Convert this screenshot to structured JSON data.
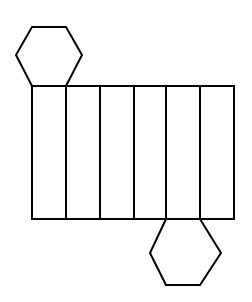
{
  "figure": {
    "title": "Net of a hexagonal prism",
    "canvas": {
      "width": 252,
      "height": 302,
      "background_color": "#ffffff"
    },
    "style": {
      "stroke_color": "#000000",
      "stroke_width": 2,
      "fill_color": "#ffffff"
    },
    "geometry": {
      "band": {
        "name": "lateral-faces-band",
        "left": 32,
        "right": 234,
        "top": 86,
        "bottom": 219,
        "panel_count": 6,
        "divider_x": [
          32,
          66,
          100,
          134,
          166,
          200,
          234
        ],
        "panels": [
          {
            "index": 1,
            "x0": 32,
            "x1": 66,
            "y0": 86,
            "y1": 219
          },
          {
            "index": 2,
            "x0": 66,
            "x1": 100,
            "y0": 86,
            "y1": 219
          },
          {
            "index": 3,
            "x0": 100,
            "x1": 134,
            "y0": 86,
            "y1": 219
          },
          {
            "index": 4,
            "x0": 134,
            "x1": 166,
            "y0": 86,
            "y1": 219
          },
          {
            "index": 5,
            "x0": 166,
            "x1": 200,
            "y0": 86,
            "y1": 219
          },
          {
            "index": 6,
            "x0": 200,
            "x1": 234,
            "y0": 86,
            "y1": 219
          }
        ]
      },
      "top_hexagon": {
        "name": "top-hexagon-face",
        "attached_to_panel": 1,
        "position": "above",
        "points": "32,86 16,55 32,27 66,27 82,55 66,86"
      },
      "bottom_hexagon": {
        "name": "bottom-hexagon-face",
        "attached_to_panel": 5,
        "position": "below",
        "points": "166,219 150,253 166,285 200,285 221,253 200,219"
      },
      "band_outline": "32,86 234,86 234,219 32,219"
    }
  }
}
